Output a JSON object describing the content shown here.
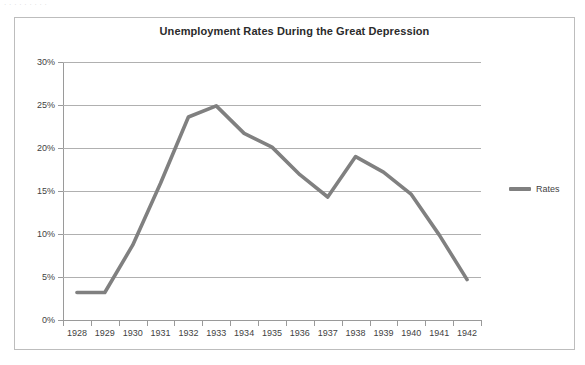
{
  "scan_artifact": {
    "text": "· · ·  ·  · · ·   · ·"
  },
  "chart_data": {
    "type": "line",
    "title": "Unemployment Rates During the Great Depression",
    "xlabel": "",
    "ylabel": "",
    "categories": [
      "1928",
      "1929",
      "1930",
      "1931",
      "1932",
      "1933",
      "1934",
      "1935",
      "1936",
      "1937",
      "1938",
      "1939",
      "1940",
      "1941",
      "1942"
    ],
    "series": [
      {
        "name": "Rates",
        "color": "#808080",
        "values": [
          3.2,
          3.2,
          8.7,
          15.9,
          23.6,
          24.9,
          21.7,
          20.1,
          16.9,
          14.3,
          19.0,
          17.2,
          14.6,
          9.9,
          4.7
        ]
      }
    ],
    "ylim": [
      0,
      30
    ],
    "ytick_values": [
      0,
      5,
      10,
      15,
      20,
      25,
      30
    ],
    "ytick_labels": [
      "0%",
      "5%",
      "10%",
      "15%",
      "20%",
      "25%",
      "30%"
    ],
    "grid": true,
    "legend_position": "right",
    "legend_entries": [
      "Rates"
    ],
    "value_unit": "%"
  },
  "colors": {
    "line": "#808080",
    "gridline": "#b0b0b0",
    "axis": "#9a9a9a",
    "border": "#bdbdbd",
    "title_text": "#2b2b2b",
    "tick_text": "#3f3f3f",
    "background": "#ffffff"
  }
}
